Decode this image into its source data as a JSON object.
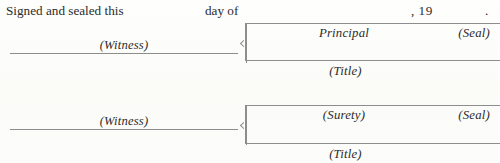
{
  "document": {
    "kind": "signature-block",
    "background_color": "#fdfdfb",
    "ink_color": "#2b2b2b",
    "rule_color": "#8d8d8d"
  },
  "statement": {
    "lead": "Signed and sealed this",
    "day_of": "day of",
    "year_prefix": ", 19",
    "period": "."
  },
  "blocks": [
    {
      "witness_caption": "(Witness)",
      "role_caption": "Principal",
      "seal_caption": "(Seal)",
      "title_caption": "(Title)"
    },
    {
      "witness_caption": "(Witness)",
      "role_caption": "(Surety)",
      "seal_caption": "(Seal)",
      "title_caption": "(Title)"
    }
  ]
}
